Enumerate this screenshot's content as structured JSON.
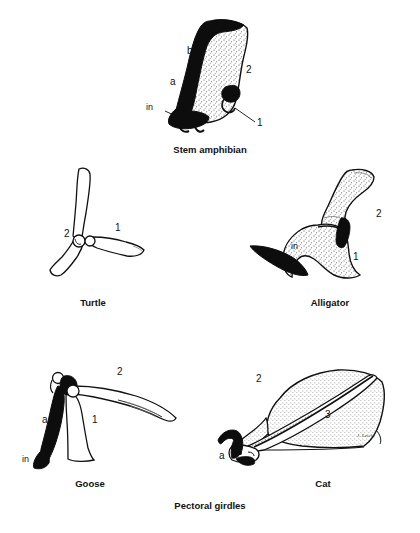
{
  "figure": {
    "caption": "Pectoral girdles",
    "signature": "J. Leicht"
  },
  "colors": {
    "ink": "#111111",
    "fill_black": "#0d0d0d",
    "fill_white": "#ffffff",
    "stipple": "#4a4a4a",
    "background": "#ffffff"
  },
  "specimens": [
    {
      "id": "stem-amphibian",
      "name": "Stem amphibian",
      "labels": [
        {
          "key": "b",
          "text": "b"
        },
        {
          "key": "a",
          "text": "a"
        },
        {
          "key": "in",
          "text": "in"
        },
        {
          "key": "two",
          "text": "2"
        },
        {
          "key": "one",
          "text": "1"
        }
      ]
    },
    {
      "id": "turtle",
      "name": "Turtle",
      "labels": [
        {
          "key": "two",
          "text": "2"
        },
        {
          "key": "one",
          "text": "1"
        }
      ]
    },
    {
      "id": "alligator",
      "name": "Alligator",
      "labels": [
        {
          "key": "two",
          "text": "2"
        },
        {
          "key": "in",
          "text": "in"
        },
        {
          "key": "one",
          "text": "1"
        }
      ]
    },
    {
      "id": "goose",
      "name": "Goose",
      "labels": [
        {
          "key": "two",
          "text": "2"
        },
        {
          "key": "a",
          "text": "a"
        },
        {
          "key": "one",
          "text": "1"
        },
        {
          "key": "in",
          "text": "in"
        }
      ]
    },
    {
      "id": "cat",
      "name": "Cat",
      "labels": [
        {
          "key": "two",
          "text": "2"
        },
        {
          "key": "three",
          "text": "3"
        },
        {
          "key": "a",
          "text": "a"
        }
      ]
    }
  ]
}
